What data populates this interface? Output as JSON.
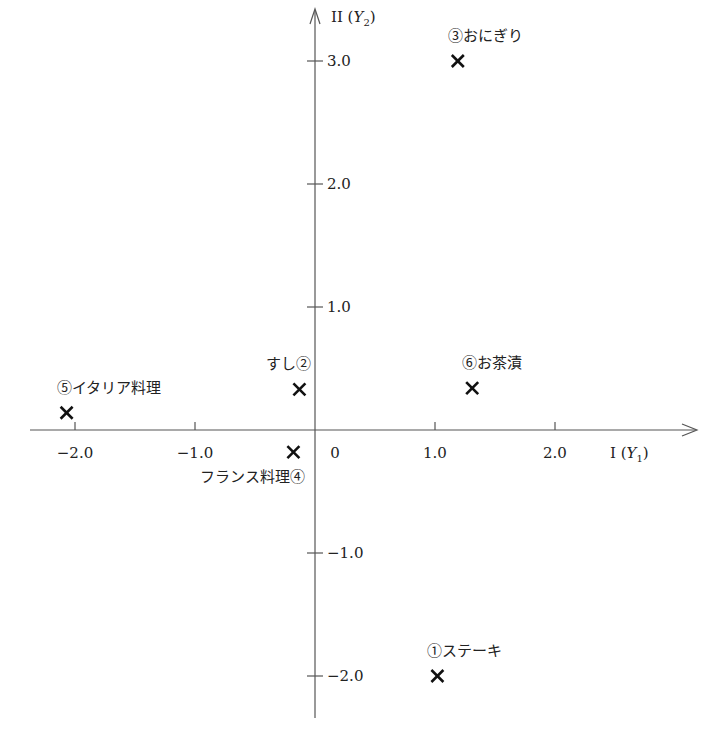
{
  "chart_data": {
    "type": "scatter",
    "title": "",
    "xlabel": "I (Y1)",
    "ylabel": "II (Y2)",
    "xaxis": {
      "label_main": "I",
      "label_var": "Y",
      "label_sub": "1",
      "ticks": [
        -2.0,
        -1.0,
        1.0,
        2.0
      ],
      "tick_labels": [
        "−2.0",
        "−1.0",
        "1.0",
        "2.0"
      ],
      "origin_label": "0",
      "range": [
        -2.4,
        3.1
      ]
    },
    "yaxis": {
      "label_main": "II",
      "label_var": "Y",
      "label_sub": "2",
      "ticks": [
        3.0,
        2.0,
        1.0,
        -1.0,
        -2.0
      ],
      "tick_labels": [
        "3.0",
        "2.0",
        "1.0",
        "−1.0",
        "−2.0"
      ],
      "range": [
        -2.4,
        3.3
      ]
    },
    "grid": false,
    "legend": null,
    "marker": "x",
    "points": [
      {
        "id": 1,
        "label": "①ステーキ",
        "x": 1.02,
        "y": -2.0,
        "label_pos": "above"
      },
      {
        "id": 2,
        "label": "すし②",
        "x": -0.13,
        "y": 0.33,
        "label_pos": "above-left"
      },
      {
        "id": 3,
        "label": "③おにぎり",
        "x": 1.19,
        "y": 3.0,
        "label_pos": "above"
      },
      {
        "id": 4,
        "label": "フランス料理④",
        "x": -0.18,
        "y": -0.18,
        "label_pos": "below-left"
      },
      {
        "id": 5,
        "label": "⑤イタリア料理",
        "x": -2.07,
        "y": 0.14,
        "label_pos": "above"
      },
      {
        "id": 6,
        "label": "⑥お茶漬",
        "x": 1.31,
        "y": 0.34,
        "label_pos": "above"
      }
    ]
  }
}
